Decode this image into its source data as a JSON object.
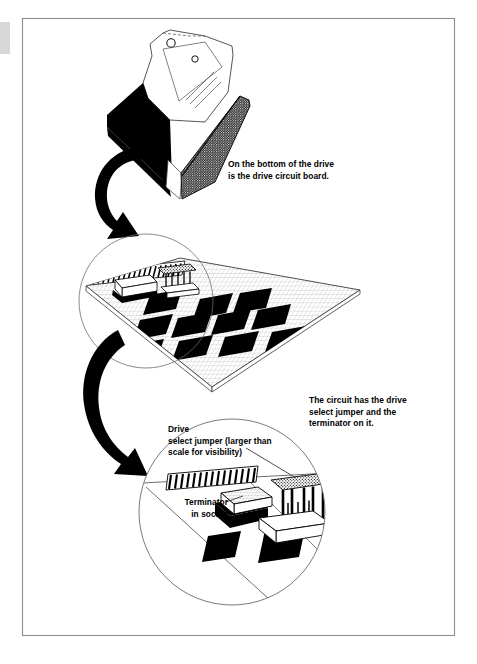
{
  "document": {
    "kind": "technical-illustration",
    "subject": "disk drive circuit board, drive select jumper and terminator",
    "background_color": "#ffffff",
    "ink_color": "#000000",
    "frame_color": "#8a8a8a"
  },
  "frame": {
    "x": 22,
    "y": 18,
    "width": 433,
    "height": 618
  },
  "captions": {
    "bottom_of_drive": "On the bottom of the drive\nis the drive circuit board.",
    "circuit_has": "The circuit has the drive\nselect jumper and the\nterminator on it.",
    "drive_select_jumper": "Drive\nselect jumper (larger than\nscale for visibility)",
    "terminator_in_socket": "Terminator\nin socket"
  },
  "figure_parts": [
    {
      "name": "disk-drive-body",
      "description": "Isometric disk drive shown upside down with black shaded side faces and mounting holes",
      "position": "top"
    },
    {
      "name": "curved-arrow-upper",
      "description": "Thick black curved arrow pointing from drive down to circuit board view",
      "position": "upper-left"
    },
    {
      "name": "circuit-board",
      "description": "Parallelogram circuit board with fine grid texture and black rectangular chips",
      "position": "middle"
    },
    {
      "name": "magnifier-circle-upper",
      "description": "Thin circle outlining the connector area of the circuit board",
      "position": "middle-left"
    },
    {
      "name": "curved-arrow-lower",
      "description": "Thick black curved arrow pointing from circuit board down to detail view",
      "position": "lower-left"
    },
    {
      "name": "detail-circle",
      "description": "Thin circle enclosing enlarged detail of jumper, terminator and edge connector",
      "position": "bottom"
    },
    {
      "name": "edge-connector",
      "description": "Striped hatched edge connector strip",
      "position": "detail"
    },
    {
      "name": "terminator-block",
      "description": "White grid-patterned resistor pack seated in a black socket",
      "position": "detail"
    },
    {
      "name": "drive-select-jumper",
      "description": "Stippled jumper block on vertical pins above a white base",
      "position": "detail"
    }
  ],
  "chip_counts": {
    "circuit_board_chips": 12,
    "detail_chips": 2
  }
}
